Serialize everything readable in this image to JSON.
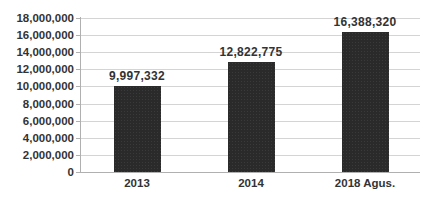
{
  "chart_data": {
    "type": "bar",
    "title": "",
    "xlabel": "",
    "ylabel": "",
    "categories": [
      "2013",
      "2014",
      "2018 Agus."
    ],
    "values": [
      9997332,
      12822775,
      16388320
    ],
    "value_labels": [
      "9,997,332",
      "12,822,775",
      "16,388,320"
    ],
    "ylim": [
      0,
      18000000
    ],
    "yticks": [
      0,
      2000000,
      4000000,
      6000000,
      8000000,
      10000000,
      12000000,
      14000000,
      16000000,
      18000000
    ],
    "ytick_labels": [
      "0",
      "2,000,000",
      "4,000,000",
      "6,000,000",
      "8,000,000",
      "10,000,000",
      "12,000,000",
      "14,000,000",
      "16,000,000",
      "18,000,000"
    ],
    "grid": true,
    "legend": "none",
    "bar_color": "#2a2a2a"
  }
}
